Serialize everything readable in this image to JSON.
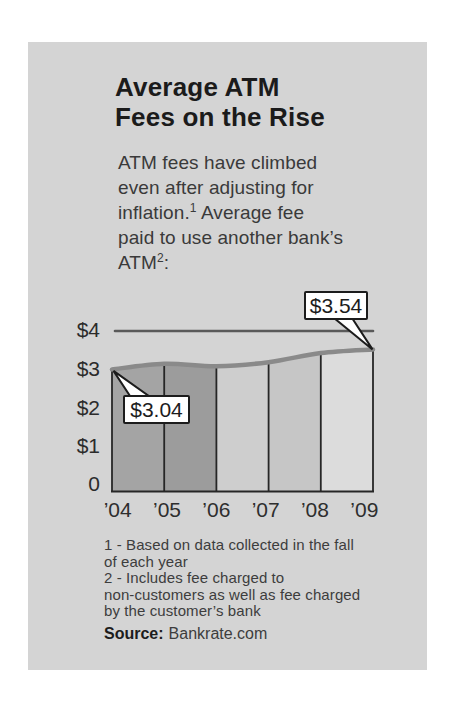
{
  "title": {
    "line1": "Average ATM",
    "line2": "Fees on the Rise"
  },
  "intro": {
    "line1": "ATM fees have climbed",
    "line2": "even after adjusting for",
    "line3_before_sup": "inflation.",
    "line3_sup": "1",
    "line3_after_sup": " Average fee",
    "line4": "paid to use another bank’s",
    "line5_before_sup": "ATM",
    "line5_sup": "2",
    "line5_after_sup": ":"
  },
  "chart_data": {
    "type": "area",
    "title": "Average ATM Fees on the Rise",
    "x": [
      "’04",
      "’05",
      "’06",
      "’07",
      "’08",
      "’09"
    ],
    "values": [
      3.04,
      3.18,
      3.12,
      3.22,
      3.45,
      3.54
    ],
    "labeled_points": [
      {
        "x": "’04",
        "value": 3.04,
        "label": "$3.04"
      },
      {
        "x": "’09",
        "value": 3.54,
        "label": "$3.54"
      }
    ],
    "ylim": [
      0,
      4
    ],
    "ytick_labels": [
      "$4",
      "$3",
      "$2",
      "$1",
      "0"
    ],
    "gridline_value": 4,
    "legend": "none",
    "colors": {
      "segments": [
        "#a4a4a4",
        "#9c9c9c",
        "#cecece",
        "#c6c6c6",
        "#dcdcdc"
      ],
      "curve": "#8a8a8a",
      "gridline": "#5a5a5a",
      "axis": "#262626",
      "callout_bg": "#ffffff",
      "callout_border": "#1c1c1c",
      "card_bg": "#d4d4d4"
    }
  },
  "footnotes": {
    "lines": [
      "1 - Based on data collected in the fall",
      "of each year",
      "2 - Includes fee charged to",
      "non-customers as well as fee charged",
      "by the customer’s bank"
    ]
  },
  "source": {
    "label": "Source:",
    "value": "Bankrate.com"
  }
}
